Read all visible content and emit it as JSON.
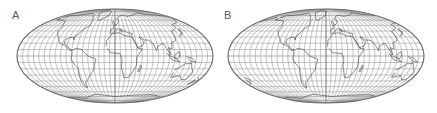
{
  "figure": {
    "panels": [
      {
        "label": "A",
        "projection": "Mollweide",
        "central_meridian_deg": 0,
        "graticule_spacing_deg": 10,
        "ellipse": {
          "cx": 115,
          "cy": 56,
          "rx": 98,
          "ry": 47
        }
      },
      {
        "label": "B",
        "projection": "Mollweide",
        "central_meridian_deg": -20,
        "graticule_spacing_deg": 10,
        "ellipse": {
          "cx": 326,
          "cy": 56,
          "rx": 98,
          "ry": 47
        }
      }
    ],
    "colors": {
      "graticule": "#9a9a9a",
      "coastline": "#555555",
      "outline": "#6a6a6a",
      "background": "#ffffff"
    }
  }
}
